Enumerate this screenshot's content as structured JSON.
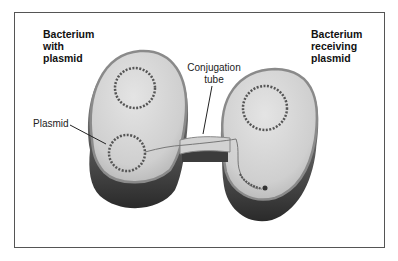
{
  "diagram": {
    "labels": {
      "donor_line1": "Bacterium",
      "donor_line2": "with",
      "donor_line3": "plasmid",
      "recipient_line1": "Bacterium",
      "recipient_line2": "receiving",
      "recipient_line3": "plasmid",
      "tube_line1": "Conjugation",
      "tube_line2": "tube",
      "plasmid": "Plasmid"
    },
    "colors": {
      "cell_fill": "#d6d6d6",
      "cell_shadow": "#3a3a3a",
      "cell_rim": "#8a8a8a",
      "frame_border": "#555555",
      "dna": "#555555"
    }
  }
}
